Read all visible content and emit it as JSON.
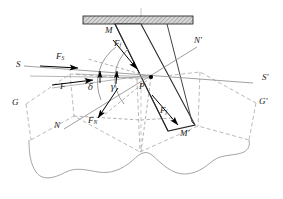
{
  "figure": {
    "type": "technical-mechanics-diagram",
    "colors": {
      "solid_line": "#1a1a1a",
      "thin_line": "#8a8a8a",
      "dashed_line": "#9a9a9a",
      "ground_curve": "#a0a0a0",
      "hatch_fill": "#c8c8c8",
      "arrow_fill": "#000000",
      "label_text": "#1a1a1a"
    }
  },
  "labels": {
    "force_s": {
      "base": "F",
      "sub": "S",
      "x": 58,
      "y": 58
    },
    "force_f_upper": {
      "base": "F",
      "sub": "f",
      "x": 116,
      "y": 45
    },
    "force_resultant": {
      "base": "F",
      "sub": "",
      "x": 62,
      "y": 88
    },
    "force_n": {
      "base": "F",
      "sub": "N",
      "x": 90,
      "y": 122
    },
    "force_f_lower": {
      "base": "F",
      "sub": "f",
      "x": 162,
      "y": 112
    },
    "angle_delta": {
      "base": "δ",
      "sub": "",
      "x": 89,
      "y": 90
    },
    "angle_gamma": {
      "base": "γ",
      "sub": "",
      "x": 111,
      "y": 90
    },
    "point_p": {
      "base": "P",
      "sub": "",
      "x": 141,
      "y": 89
    },
    "axis_s_left": {
      "base": "S",
      "sub": "",
      "x": 16,
      "y": 67
    },
    "axis_s_right": {
      "base": "S'",
      "sub": "",
      "x": 262,
      "y": 80
    },
    "axis_n_left": {
      "base": "N",
      "sub": "",
      "x": 56,
      "y": 128
    },
    "axis_n_right": {
      "base": "N'",
      "sub": "",
      "x": 196,
      "y": 43
    },
    "axis_g_left": {
      "base": "G",
      "sub": "",
      "x": 13,
      "y": 105
    },
    "axis_g_right": {
      "base": "G'",
      "sub": "",
      "x": 260,
      "y": 104
    },
    "blade_top_m": {
      "base": "M",
      "sub": "",
      "x": 106,
      "y": 32
    },
    "blade_bottom_m": {
      "base": "M'",
      "sub": "",
      "x": 182,
      "y": 135
    }
  },
  "elements": {
    "mounting_plate": "hatched-horizontal-plate",
    "blade": "tilted-rectangular-blade",
    "ground_surface": "wavy-ground-profile",
    "pivot_point": "point-P-marker",
    "angle_arcs": [
      "delta-arc",
      "gamma-arc"
    ],
    "force_vectors": [
      "F_S",
      "F",
      "F_N",
      "F_f-upper",
      "F_f-lower"
    ]
  }
}
